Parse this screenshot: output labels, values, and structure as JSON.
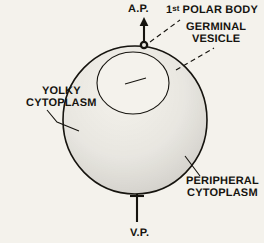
{
  "figure": {
    "background_color": "#f4f2ec",
    "ink_color": "#16140f"
  },
  "labels": {
    "animal_pole": "A.P.",
    "vegetal_pole": "V.P.",
    "polar_body_prefix": "1",
    "polar_body_suffix": "st",
    "polar_body_rest": " POLAR BODY",
    "germinal_vesicle_line1": "GERMINAL",
    "germinal_vesicle_line2": "VESICLE",
    "yolky_cytoplasm_line1": "YOLKY",
    "yolky_cytoplasm_line2": "CYTOPLASM",
    "peripheral_cytoplasm_line1": "PERIPHERAL",
    "peripheral_cytoplasm_line2": "CYTOPLASM"
  },
  "structures": {
    "cell_outline": {
      "cx": 135,
      "cy": 120,
      "rx": 72,
      "ry": 74
    },
    "germinal_vesicle": {
      "cx": 133,
      "cy": 83,
      "rx": 36,
      "ry": 31
    },
    "polar_body": {
      "cx": 144,
      "cy": 45,
      "r": 4
    },
    "animal_pole_axis": {
      "x": 144,
      "y_top": 18,
      "y_bottom": 46
    },
    "vegetal_pole_axis": {
      "x": 137,
      "y_top": 194,
      "y_bottom": 222
    }
  }
}
